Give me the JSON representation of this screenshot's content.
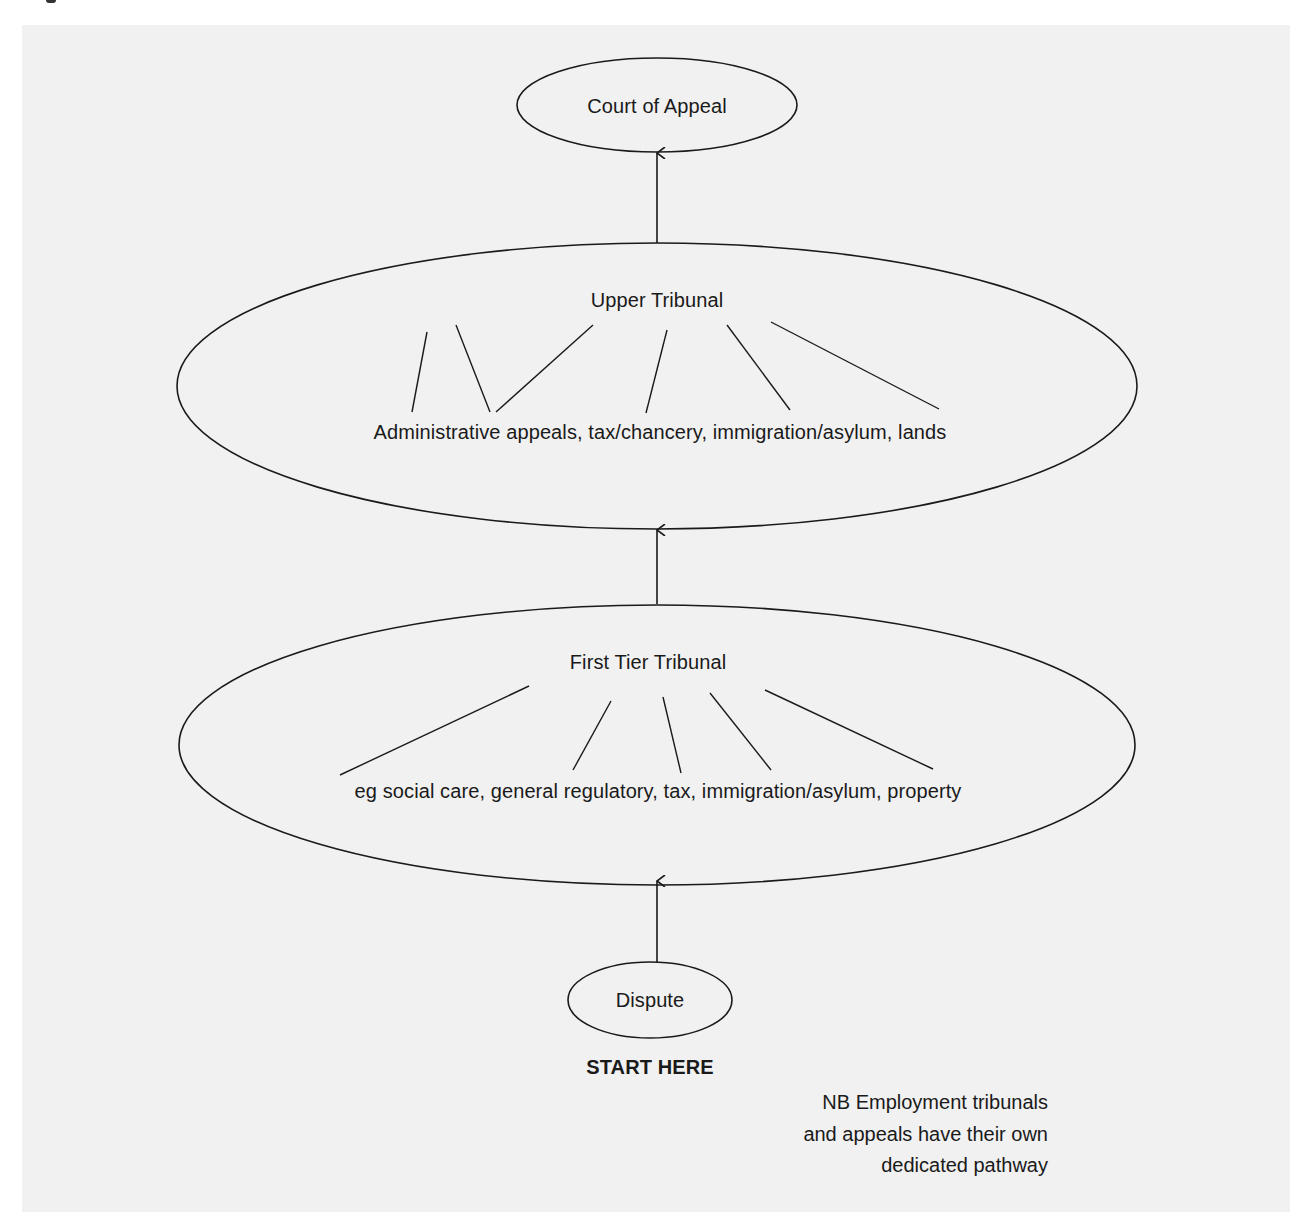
{
  "diagram": {
    "nodes": {
      "court_of_appeal": {
        "label": "Court of Appeal"
      },
      "upper_tribunal": {
        "label": "Upper Tribunal",
        "chambers": "Administrative appeals, tax/chancery, immigration/asylum, lands"
      },
      "first_tier_tribunal": {
        "label": "First Tier Tribunal",
        "chambers": "eg social care, general regulatory, tax, immigration/asylum, property"
      },
      "dispute": {
        "label": "Dispute"
      }
    },
    "edges": [
      {
        "from": "dispute",
        "to": "first_tier_tribunal"
      },
      {
        "from": "first_tier_tribunal",
        "to": "upper_tribunal"
      },
      {
        "from": "upper_tribunal",
        "to": "court_of_appeal"
      }
    ],
    "start_label": "START HERE",
    "note": {
      "lines": [
        "NB Employment tribunals",
        "and appeals have their own",
        "dedicated pathway"
      ]
    },
    "colors": {
      "background": "#f1f1f1",
      "stroke": "#1a1a1a",
      "text": "#1a1a1a"
    }
  }
}
